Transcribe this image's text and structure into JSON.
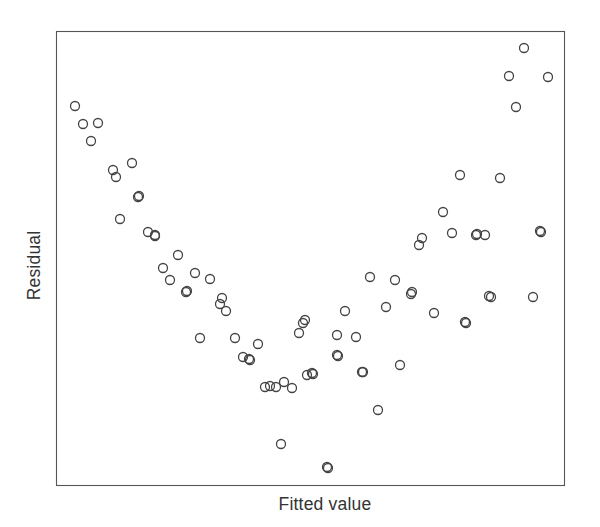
{
  "figure": {
    "type": "scatter-plot",
    "background_color": "#ffffff",
    "frame_color": "#555555",
    "marker_color": "#444444",
    "text_color": "#333333"
  },
  "labels": {
    "x_axis": "Fitted value",
    "y_axis": "Residual"
  },
  "chart_data": {
    "type": "scatter",
    "title": "",
    "xlabel": "Fitted value",
    "ylabel": "Residual",
    "xlim": [
      0,
      100
    ],
    "ylim": [
      0,
      100
    ],
    "grid": false,
    "legend": null,
    "xticks": [],
    "yticks": [],
    "annotations": [],
    "marker": {
      "shape": "open-circle",
      "diameter_px": 9,
      "stroke_width_px": 1.3,
      "fill": "none"
    },
    "plot_frame_px": {
      "left": 56,
      "top": 31,
      "right": 564,
      "bottom": 485
    },
    "n_points": 78,
    "points_px": [
      [
        75,
        106
      ],
      [
        83,
        124
      ],
      [
        98,
        123
      ],
      [
        91,
        141
      ],
      [
        113,
        170
      ],
      [
        116,
        177
      ],
      [
        132,
        163
      ],
      [
        138,
        197
      ],
      [
        120,
        219
      ],
      [
        148,
        232
      ],
      [
        155,
        236
      ],
      [
        178,
        255
      ],
      [
        163,
        268
      ],
      [
        195,
        273
      ],
      [
        170,
        280
      ],
      [
        186,
        292
      ],
      [
        210,
        279
      ],
      [
        220,
        304
      ],
      [
        226,
        311
      ],
      [
        200,
        338
      ],
      [
        235,
        338
      ],
      [
        258,
        344
      ],
      [
        243,
        357
      ],
      [
        250,
        360
      ],
      [
        265,
        387
      ],
      [
        270,
        386
      ],
      [
        281,
        444
      ],
      [
        284,
        382
      ],
      [
        292,
        388
      ],
      [
        299,
        333
      ],
      [
        303,
        323
      ],
      [
        305,
        320
      ],
      [
        313,
        374
      ],
      [
        312,
        373
      ],
      [
        327,
        467
      ],
      [
        337,
        335
      ],
      [
        337,
        355
      ],
      [
        338,
        356
      ],
      [
        345,
        311
      ],
      [
        356,
        337
      ],
      [
        362,
        372
      ],
      [
        363,
        372
      ],
      [
        370,
        277
      ],
      [
        378,
        410
      ],
      [
        386,
        307
      ],
      [
        395,
        280
      ],
      [
        400,
        365
      ],
      [
        411,
        294
      ],
      [
        412,
        292
      ],
      [
        419,
        245
      ],
      [
        422,
        238
      ],
      [
        434,
        313
      ],
      [
        443,
        212
      ],
      [
        452,
        233
      ],
      [
        460,
        175
      ],
      [
        465,
        322
      ],
      [
        466,
        323
      ],
      [
        476,
        235
      ],
      [
        485,
        235
      ],
      [
        489,
        296
      ],
      [
        491,
        297
      ],
      [
        500,
        178
      ],
      [
        509,
        76
      ],
      [
        516,
        107
      ],
      [
        524,
        48
      ],
      [
        533,
        297
      ],
      [
        540,
        231
      ],
      [
        548,
        77
      ],
      [
        307,
        375
      ],
      [
        249,
        359
      ],
      [
        187,
        291
      ],
      [
        222,
        298
      ],
      [
        139,
        196
      ],
      [
        155,
        235
      ],
      [
        276,
        387
      ],
      [
        328,
        468
      ],
      [
        477,
        234
      ],
      [
        541,
        232
      ]
    ],
    "x": [
      3.7,
      5.3,
      8.3,
      6.9,
      11.2,
      11.8,
      15.0,
      16.1,
      12.6,
      18.1,
      19.5,
      24.0,
      21.1,
      27.4,
      22.4,
      25.6,
      30.3,
      32.3,
      33.5,
      28.3,
      35.2,
      39.8,
      36.8,
      38.2,
      41.1,
      42.1,
      44.3,
      44.9,
      46.5,
      47.8,
      48.6,
      49.0,
      50.6,
      50.4,
      53.3,
      55.3,
      55.3,
      55.5,
      56.9,
      59.1,
      60.2,
      60.4,
      61.8,
      63.4,
      65.0,
      66.7,
      67.7,
      69.9,
      70.1,
      71.5,
      72.0,
      74.4,
      76.2,
      77.9,
      79.5,
      80.5,
      80.7,
      82.7,
      84.4,
      85.2,
      85.6,
      87.4,
      89.2,
      90.6,
      92.1,
      93.9,
      95.3,
      96.9,
      49.4,
      38.0,
      25.8,
      32.7,
      16.3,
      19.5,
      43.3,
      53.5,
      82.9,
      95.5
    ],
    "y": [
      83.5,
      79.5,
      79.7,
      75.8,
      69.4,
      67.8,
      70.9,
      63.4,
      58.6,
      55.7,
      54.8,
      50.6,
      47.8,
      46.7,
      45.2,
      42.5,
      45.4,
      39.9,
      38.3,
      32.4,
      32.4,
      31.1,
      28.2,
      27.5,
      21.6,
      21.8,
      9.0,
      22.7,
      21.4,
      33.5,
      35.7,
      36.4,
      24.4,
      24.7,
      4.0,
      33.0,
      28.6,
      28.4,
      38.3,
      32.6,
      24.9,
      24.9,
      45.8,
      16.5,
      39.2,
      45.1,
      26.4,
      42.1,
      42.5,
      52.9,
      54.4,
      37.9,
      60.1,
      55.5,
      68.3,
      35.9,
      35.7,
      55.1,
      55.1,
      41.6,
      41.4,
      67.6,
      90.1,
      83.3,
      96.3,
      41.4,
      56.0,
      89.9,
      24.2,
      27.8,
      42.7,
      41.2,
      63.6,
      55.0,
      21.6,
      3.7,
      55.3,
      55.8
    ]
  }
}
